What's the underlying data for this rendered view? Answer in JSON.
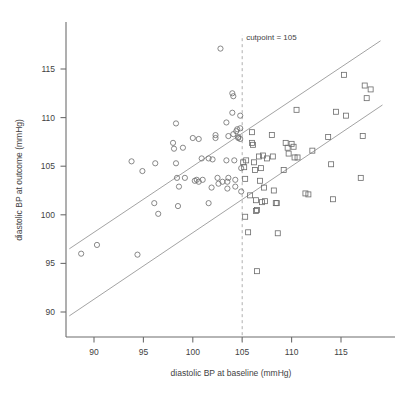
{
  "chart_data": {
    "type": "scatter",
    "title": "",
    "xlabel": "diastolic BP at baseline (mmHg)",
    "ylabel": "diastolic BP at outcome (mmHg)",
    "xlim": [
      87.5,
      119.5
    ],
    "ylim": [
      87.0,
      118.5
    ],
    "xticks": [
      90,
      95,
      100,
      105,
      110,
      115
    ],
    "yticks": [
      90,
      95,
      100,
      105,
      110,
      115
    ],
    "xtick_labels": [
      "90",
      "95",
      "100",
      "105",
      "110",
      "115"
    ],
    "ytick_labels": [
      "90",
      "95",
      "100",
      "105",
      "110",
      "115"
    ],
    "grid": false,
    "legend": "none",
    "annotations": [
      {
        "name": "cutpoint-label",
        "text": "cutpoint = 105",
        "x": 105.2,
        "y": 118.0
      }
    ],
    "reference_lines": [
      {
        "name": "upper-agreement-line",
        "style": "solid",
        "x0": 87.5,
        "y0": 96.5,
        "x1": 119.0,
        "y1": 117.9
      },
      {
        "name": "lower-agreement-line",
        "style": "solid",
        "x0": 87.5,
        "y0": 89.6,
        "x1": 119.2,
        "y1": 111.3
      },
      {
        "name": "cutpoint-vertical-line",
        "style": "dashed",
        "x0": 105,
        "y0": 87.0,
        "x1": 105,
        "y1": 118.5
      }
    ],
    "series": [
      {
        "name": "below cutpoint",
        "marker": "circle",
        "points": [
          [
            88.7,
            96.0
          ],
          [
            90.3,
            96.9
          ],
          [
            94.4,
            95.9
          ],
          [
            93.8,
            105.5
          ],
          [
            94.9,
            104.5
          ],
          [
            96.2,
            105.3
          ],
          [
            96.1,
            101.2
          ],
          [
            96.5,
            100.1
          ],
          [
            98.3,
            109.4
          ],
          [
            98.0,
            107.4
          ],
          [
            98.1,
            106.8
          ],
          [
            98.3,
            105.3
          ],
          [
            98.4,
            103.8
          ],
          [
            98.6,
            102.9
          ],
          [
            98.5,
            100.9
          ],
          [
            100.0,
            107.9
          ],
          [
            100.2,
            103.5
          ],
          [
            100.4,
            103.6
          ],
          [
            100.6,
            107.8
          ],
          [
            100.6,
            103.4
          ],
          [
            101.6,
            105.8
          ],
          [
            101.6,
            101.2
          ],
          [
            102.3,
            107.9
          ],
          [
            102.3,
            108.2
          ],
          [
            102.5,
            103.8
          ],
          [
            102.6,
            103.2
          ],
          [
            102.8,
            117.1
          ],
          [
            103.4,
            109.5
          ],
          [
            103.4,
            105.6
          ],
          [
            103.5,
            102.7
          ],
          [
            103.6,
            108.1
          ],
          [
            103.5,
            103.4
          ],
          [
            103.6,
            103.8
          ],
          [
            104.0,
            110.5
          ],
          [
            104.0,
            112.5
          ],
          [
            104.1,
            112.2
          ],
          [
            104.1,
            108.3
          ],
          [
            104.2,
            105.6
          ],
          [
            104.3,
            103.6
          ],
          [
            104.3,
            102.9
          ],
          [
            104.4,
            108.6
          ],
          [
            104.5,
            108.8
          ],
          [
            104.6,
            108.0
          ],
          [
            104.6,
            107.9
          ],
          [
            104.8,
            110.2
          ],
          [
            104.8,
            108.9
          ],
          [
            104.8,
            107.8
          ],
          [
            104.9,
            104.8
          ],
          [
            104.9,
            102.4
          ],
          [
            101.0,
            103.6
          ],
          [
            99.2,
            103.8
          ],
          [
            101.9,
            102.8
          ],
          [
            103.0,
            103.4
          ],
          [
            102.0,
            105.7
          ],
          [
            100.9,
            105.8
          ],
          [
            99.0,
            106.9
          ]
        ]
      },
      {
        "name": "at or above cutpoint",
        "marker": "square",
        "points": [
          [
            105.1,
            105.4
          ],
          [
            105.2,
            104.9
          ],
          [
            105.3,
            103.7
          ],
          [
            105.3,
            99.8
          ],
          [
            105.4,
            105.6
          ],
          [
            105.6,
            98.2
          ],
          [
            106.0,
            108.5
          ],
          [
            106.0,
            107.4
          ],
          [
            106.1,
            107.2
          ],
          [
            106.2,
            105.4
          ],
          [
            106.3,
            104.6
          ],
          [
            106.4,
            101.5
          ],
          [
            106.4,
            100.4
          ],
          [
            106.5,
            100.5
          ],
          [
            106.5,
            94.2
          ],
          [
            106.7,
            106.0
          ],
          [
            106.9,
            104.8
          ],
          [
            107.0,
            101.3
          ],
          [
            107.1,
            106.1
          ],
          [
            107.2,
            102.8
          ],
          [
            107.3,
            101.4
          ],
          [
            108.0,
            108.2
          ],
          [
            108.1,
            106.0
          ],
          [
            108.2,
            102.5
          ],
          [
            108.4,
            101.2
          ],
          [
            108.5,
            101.2
          ],
          [
            108.6,
            98.1
          ],
          [
            109.2,
            104.6
          ],
          [
            109.4,
            107.4
          ],
          [
            109.6,
            106.9
          ],
          [
            109.7,
            106.3
          ],
          [
            110.0,
            107.3
          ],
          [
            110.2,
            107.0
          ],
          [
            110.3,
            105.9
          ],
          [
            110.5,
            110.8
          ],
          [
            110.6,
            105.9
          ],
          [
            111.4,
            102.2
          ],
          [
            111.7,
            102.1
          ],
          [
            112.1,
            106.6
          ],
          [
            113.7,
            108.0
          ],
          [
            114.0,
            105.2
          ],
          [
            114.2,
            101.6
          ],
          [
            114.5,
            110.6
          ],
          [
            115.3,
            114.4
          ],
          [
            115.5,
            110.2
          ],
          [
            117.0,
            103.8
          ],
          [
            117.2,
            108.1
          ],
          [
            117.4,
            113.3
          ],
          [
            117.6,
            112.0
          ],
          [
            118.0,
            112.9
          ],
          [
            105.8,
            102.0
          ],
          [
            107.5,
            105.8
          ],
          [
            106.8,
            103.5
          ]
        ]
      }
    ]
  }
}
